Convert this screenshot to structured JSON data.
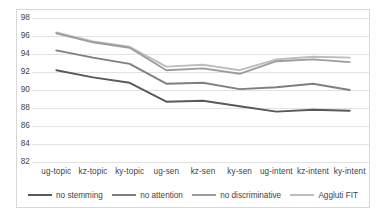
{
  "chart_data": {
    "type": "line",
    "title": "",
    "xlabel": "",
    "ylabel": "",
    "ylim": [
      82,
      98
    ],
    "ytick_step": 2,
    "yticks": [
      98,
      96,
      94,
      92,
      90,
      88,
      86,
      84,
      82
    ],
    "grid": true,
    "legend_position": "bottom",
    "categories": [
      "ug-topic",
      "kz-topic",
      "ky-topic",
      "ug-sen",
      "kz-sen",
      "ky-sen",
      "ug-intent",
      "kz-intent",
      "ky-intent"
    ],
    "series": [
      {
        "name": "no stemming",
        "color": "#595959",
        "values": [
          92.2,
          91.4,
          90.8,
          88.7,
          88.8,
          88.2,
          87.6,
          87.8,
          87.7
        ]
      },
      {
        "name": "no attention",
        "color": "#7f7f7f",
        "values": [
          94.4,
          93.6,
          92.9,
          90.7,
          90.8,
          90.1,
          90.3,
          90.7,
          90.0
        ]
      },
      {
        "name": "no discriminative",
        "color": "#9c9c9c",
        "values": [
          96.3,
          95.3,
          94.7,
          92.2,
          92.4,
          91.8,
          93.2,
          93.4,
          93.1
        ]
      },
      {
        "name": "Aggluti FIT",
        "color": "#bdbdbd",
        "values": [
          96.4,
          95.4,
          94.8,
          92.6,
          92.8,
          92.2,
          93.4,
          93.7,
          93.6
        ]
      }
    ]
  },
  "colors": {
    "background": "#ffffff",
    "gridline": "#e2e2e2",
    "frame_border": "#d8d8d8",
    "tick_text": "#3f3f3f"
  }
}
